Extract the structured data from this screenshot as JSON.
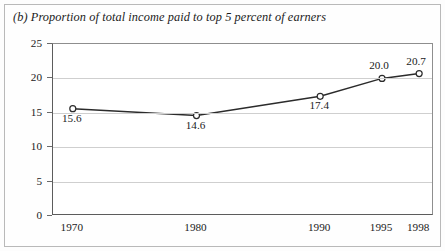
{
  "chart_data": {
    "type": "line",
    "title": "(b) Proportion of total income paid to top 5 percent of earners",
    "xlabel": "",
    "ylabel": "Percentage of total income",
    "categories": [
      "1970",
      "1980",
      "1990",
      "1995",
      "1998"
    ],
    "x": [
      1970,
      1980,
      1990,
      1995,
      1998
    ],
    "values": [
      15.6,
      14.6,
      17.4,
      20.0,
      20.7
    ],
    "point_labels": [
      "15.6",
      "14.6",
      "17.4",
      "20.0",
      "20.7"
    ],
    "point_label_position": [
      "below",
      "below",
      "below",
      "above",
      "above"
    ],
    "ylim": [
      0,
      25
    ],
    "yticks": [
      0,
      5,
      10,
      15,
      20,
      25
    ],
    "ytick_labels": [
      "0",
      "5",
      "10",
      "15",
      "20",
      "25"
    ],
    "xlim": [
      1968.4,
      1999.2
    ],
    "grid": "horizontal",
    "legend": "none",
    "marker": "open-circle",
    "line_color": "#2b2b2b",
    "grid_color": "#cfcfcf",
    "axis_color": "#5c5c5c",
    "background_color": "#ffffff"
  }
}
